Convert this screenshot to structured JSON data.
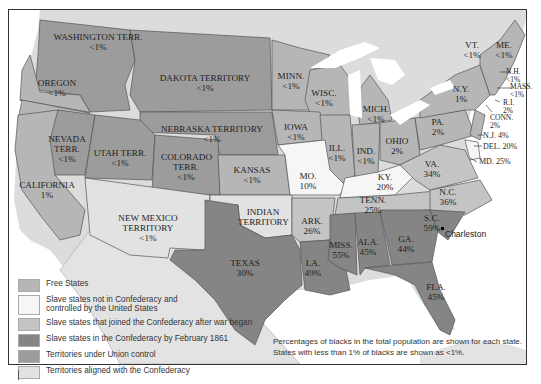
{
  "colors": {
    "free": "#b6b6b6",
    "slave_union": "#f6f6f6",
    "slave_joined_later": "#c4c4c4",
    "slave_confederacy": "#858585",
    "territory_union": "#9c9c9c",
    "territory_confederacy": "#e2e2e2",
    "foreign_land": "#dcdcdc",
    "water": "#ffffff"
  },
  "regions": [
    {
      "name": "WASHINGTON TERR.",
      "pct": "<1%"
    },
    {
      "name": "OREGON",
      "pct": "<1%"
    },
    {
      "name": "DAKOTA TERRITORY",
      "pct": "<1%"
    },
    {
      "name": "NEBRASKA TERRITORY",
      "pct": "<1%"
    },
    {
      "name": "NEVADA TERR.",
      "pct": "<1%"
    },
    {
      "name": "UTAH TERR.",
      "pct": "<1%"
    },
    {
      "name": "COLORADO TERR.",
      "pct": "<1%"
    },
    {
      "name": "CALIFORNIA",
      "pct": "1%"
    },
    {
      "name": "KANSAS",
      "pct": "<1%"
    },
    {
      "name": "NEW MEXICO TERRITORY",
      "pct": "<1%"
    },
    {
      "name": "INDIAN TERRITORY",
      "pct": ""
    },
    {
      "name": "TEXAS",
      "pct": "30%"
    },
    {
      "name": "MINN.",
      "pct": "<1%"
    },
    {
      "name": "WISC.",
      "pct": "<1%"
    },
    {
      "name": "IOWA",
      "pct": "<1%"
    },
    {
      "name": "ILL.",
      "pct": "<1%"
    },
    {
      "name": "MICH.",
      "pct": "<1%"
    },
    {
      "name": "IND.",
      "pct": "<1%"
    },
    {
      "name": "OHIO",
      "pct": "2%"
    },
    {
      "name": "MO.",
      "pct": "10%"
    },
    {
      "name": "KY.",
      "pct": "20%"
    },
    {
      "name": "ARK.",
      "pct": "26%"
    },
    {
      "name": "TENN.",
      "pct": "25%"
    },
    {
      "name": "LA.",
      "pct": "49%"
    },
    {
      "name": "MISS.",
      "pct": "55%"
    },
    {
      "name": "ALA.",
      "pct": "45%"
    },
    {
      "name": "GA.",
      "pct": "44%"
    },
    {
      "name": "S.C.",
      "pct": "59%"
    },
    {
      "name": "FLA.",
      "pct": "45%"
    },
    {
      "name": "N.C.",
      "pct": "36%"
    },
    {
      "name": "VA.",
      "pct": "34%"
    },
    {
      "name": "PA.",
      "pct": "2%"
    },
    {
      "name": "N.Y.",
      "pct": "1%"
    },
    {
      "name": "VT.",
      "pct": "<1%"
    },
    {
      "name": "ME.",
      "pct": "<1%"
    },
    {
      "name": "N.H.",
      "pct": "<1%"
    },
    {
      "name": "MASS.",
      "pct": "<1%"
    },
    {
      "name": "R.I.",
      "pct": "2%"
    },
    {
      "name": "CONN.",
      "pct": "2%"
    },
    {
      "name": "N.J.",
      "pct": "4%"
    },
    {
      "name": "DEL.",
      "pct": "20%"
    },
    {
      "name": "MD.",
      "pct": "25%"
    }
  ],
  "city": "Charleston",
  "legend": [
    {
      "label": "Free States",
      "key": "free"
    },
    {
      "label": "Slave states not in Confederacy and controlled by the United States",
      "line1": "Slave states not in Confederacy and",
      "line2": "controlled by the United States",
      "key": "slave_union"
    },
    {
      "label": "Slave states that joined the Confederacy after war began",
      "key": "slave_joined_later"
    },
    {
      "label": "Slave states in the Confederacy by February 1861",
      "key": "slave_confederacy"
    },
    {
      "label": "Territories under Union control",
      "key": "territory_union"
    },
    {
      "label": "Territories aligned with the Confederacy",
      "key": "territory_confederacy"
    }
  ],
  "note": {
    "line1": "Percentages of blacks in the total population are shown for each state.",
    "line2": "States with less than 1% of blacks are shown as <1%."
  }
}
